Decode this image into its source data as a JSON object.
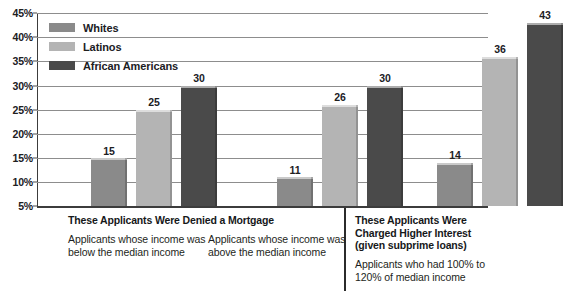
{
  "chart_data": {
    "type": "bar",
    "title": "",
    "subtitle": "",
    "xlabel": "",
    "ylabel": "",
    "ylim": [
      5,
      45
    ],
    "ytick_labels": [
      "45%",
      "40%",
      "35%",
      "30%",
      "25%",
      "20%",
      "15%",
      "10%",
      "5%"
    ],
    "ytick_values": [
      45,
      40,
      35,
      30,
      25,
      20,
      15,
      10,
      5
    ],
    "grid": true,
    "legend_position": "inside-top-left",
    "categories": [
      "Applicants whose income was below the median income",
      "Applicants whose income was above the median income",
      "Applicants who had 100% to 120% of median income"
    ],
    "series": [
      {
        "name": "Whites",
        "color": "#8a8a8a",
        "values": [
          15,
          11,
          14
        ]
      },
      {
        "name": "Latinos",
        "color": "#b4b4b4",
        "values": [
          25,
          26,
          36
        ]
      },
      {
        "name": "African Americans",
        "color": "#4a4a4a",
        "values": [
          30,
          30,
          43
        ]
      }
    ],
    "value_labels": [
      [
        "15",
        "25",
        "30"
      ],
      [
        "11",
        "26",
        "30"
      ],
      [
        "14",
        "36",
        "43"
      ]
    ]
  },
  "legend": {
    "items": [
      {
        "label": "Whites"
      },
      {
        "label": "Latinos"
      },
      {
        "label": "African Americans"
      }
    ]
  },
  "captions": {
    "section_denied": {
      "heading": "These Applicants Were Denied a Mortgage",
      "group_below": "Applicants whose income was below the median income",
      "group_above": "Applicants whose income was above the median income"
    },
    "section_interest": {
      "heading": "These Applicants Were Charged Higher Interest (given subprime loans)",
      "group_median": "Applicants who had 100% to 120% of median income"
    }
  },
  "colors": {
    "whites": "#8a8a8a",
    "latinos": "#b4b4b4",
    "african_americans": "#4a4a4a",
    "gridline": "#8d8d8d",
    "axis": "#3c3c3c",
    "text": "#20201f",
    "background": "#ffffff"
  }
}
